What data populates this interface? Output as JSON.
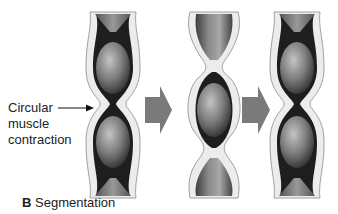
{
  "figure": {
    "panel_letter": "B",
    "caption": "Segmentation",
    "annotation": {
      "line1": "Circular",
      "line2": "muscle",
      "line3": "contraction"
    },
    "stages": [
      {
        "id": "stage-1",
        "description": "Tube with two constrictions creating two oval chyme segments"
      },
      {
        "id": "stage-2",
        "description": "Constrictions relax and shift; one central segment with half-segments above and below"
      },
      {
        "id": "stage-3",
        "description": "Tube returns to two constrictions with two oval segments"
      }
    ],
    "arrows": 2,
    "colors": {
      "arrow": "#7a7a7a",
      "tube_wall": "#e6e6e6",
      "tube_outline": "#9a9a9a",
      "chyme_dark": "#3a3a3a",
      "chyme_light": "#b8b8b8"
    }
  }
}
